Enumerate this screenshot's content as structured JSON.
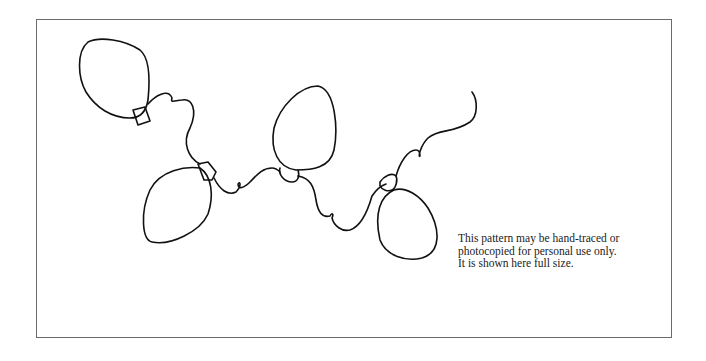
{
  "figure": {
    "bulbs_count": 4,
    "stroke_color": "#111111",
    "border_color": "#6b6b6b"
  },
  "caption": {
    "lines": [
      "This pattern may be hand-traced or",
      "photocopied for personal use only.",
      "It is shown here full size."
    ]
  }
}
